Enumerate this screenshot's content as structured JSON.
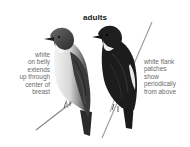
{
  "figure": {
    "title": "adults",
    "left_caption": {
      "lines": [
        "white",
        "on belly",
        "extends",
        "up through",
        "center of",
        "breast"
      ]
    },
    "right_caption": {
      "lines": [
        "white flank",
        "patches",
        "show",
        "periodically",
        "from above"
      ]
    },
    "subjects": [
      {
        "name": "bird-front-view",
        "description": "light-bellied bird perched on branch, facing left"
      },
      {
        "name": "bird-back-view",
        "description": "dark-backed bird perched on branch, facing left"
      }
    ],
    "colors": {
      "background": "#ffffff",
      "caption_text": "#6a6a6a",
      "title_text": "#1a1a1a",
      "dark_plumage": "#1c1c1c",
      "mid_plumage": "#555555",
      "light_breast": "#eeeeee",
      "branch": "#8a8a8a"
    }
  }
}
